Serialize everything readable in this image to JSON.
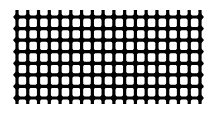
{
  "image": {
    "description": "Black woven grid / mesh pattern on white background",
    "colors": {
      "background": "#ffffff",
      "grid": "#000000"
    },
    "grid": {
      "columns_lines": 18,
      "row_lines": 8,
      "x_start": 17,
      "x_end": 200,
      "y_start": 17,
      "y_end": 98,
      "vertical_extent": [
        10,
        104
      ],
      "horizontal_extent": [
        15,
        202
      ],
      "line_width": 3.2
    }
  }
}
